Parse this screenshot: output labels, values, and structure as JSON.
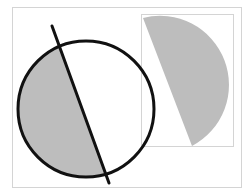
{
  "diagram": {
    "colors": {
      "background": "#ffffff",
      "frame": "#d4d4d4",
      "shade": "#bdbdbd",
      "stroke": "#111111"
    },
    "frame": {
      "x": 12,
      "y": 7,
      "width": 230,
      "height": 181
    },
    "inner_box": {
      "x": 141,
      "y": 14,
      "width": 93,
      "height": 133
    },
    "circle": {
      "cx": 86,
      "cy": 109,
      "r": 68
    },
    "cut_line": {
      "x1": 52,
      "y1": 26,
      "x2": 109,
      "y2": 183
    },
    "separated_piece": {
      "chord_start": [
        143,
        18
      ],
      "chord_end": [
        192,
        146
      ]
    }
  }
}
